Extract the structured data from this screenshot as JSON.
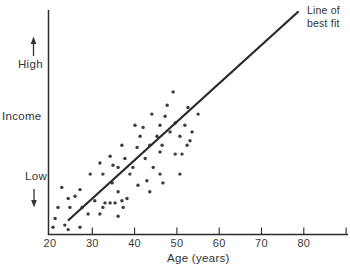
{
  "figure": {
    "background_color": "#ffffff",
    "ink_color": "#2b2b2b",
    "dot_color": "#3c3c3c"
  },
  "chart_data": {
    "type": "scatter",
    "xlabel": "Age (years)",
    "ylabel": "Income",
    "y_axis": {
      "high_label": "High",
      "low_label": "Low",
      "scale_note": "qualitative axis, arrows from Low to High, no numeric ticks"
    },
    "x_ticks_labeled": [
      20,
      30,
      40,
      50,
      60,
      70,
      80
    ],
    "x_ticks_marks": [
      30,
      40,
      50,
      60,
      70,
      80,
      90
    ],
    "xlim": [
      20,
      91
    ],
    "y_units": "relative income, 0 = baseline (Low end), 100 = top of axis",
    "ylim": [
      0,
      100
    ],
    "grid": false,
    "legend": null,
    "annotation": {
      "label_line1": "Line of",
      "label_line2": "best fit"
    },
    "best_fit_line": {
      "start": [
        24.4,
        6.3
      ],
      "end": [
        78.6,
        100
      ]
    },
    "points": [
      [
        20.7,
        3
      ],
      [
        21.2,
        7
      ],
      [
        21.9,
        12
      ],
      [
        22.8,
        21
      ],
      [
        23.5,
        4
      ],
      [
        24.3,
        2
      ],
      [
        24.3,
        16
      ],
      [
        24.7,
        12
      ],
      [
        25.9,
        17
      ],
      [
        27.1,
        20
      ],
      [
        27.1,
        3
      ],
      [
        27.6,
        12
      ],
      [
        29.0,
        9
      ],
      [
        29.5,
        27
      ],
      [
        30.6,
        15
      ],
      [
        31.8,
        9
      ],
      [
        31.8,
        32
      ],
      [
        32.5,
        27
      ],
      [
        32.5,
        12
      ],
      [
        33.0,
        14
      ],
      [
        34.2,
        35
      ],
      [
        34.2,
        14
      ],
      [
        34.7,
        23
      ],
      [
        34.9,
        31
      ],
      [
        35.4,
        14
      ],
      [
        36.1,
        8
      ],
      [
        36.1,
        19
      ],
      [
        36.1,
        30
      ],
      [
        37.0,
        15
      ],
      [
        37.0,
        40
      ],
      [
        37.3,
        12
      ],
      [
        37.7,
        34
      ],
      [
        38.2,
        16
      ],
      [
        38.9,
        27
      ],
      [
        39.6,
        30
      ],
      [
        40.1,
        49
      ],
      [
        40.6,
        39
      ],
      [
        40.8,
        22
      ],
      [
        41.3,
        44
      ],
      [
        42.0,
        48
      ],
      [
        42.5,
        34
      ],
      [
        42.9,
        24
      ],
      [
        43.6,
        19
      ],
      [
        43.6,
        40
      ],
      [
        44.1,
        54
      ],
      [
        44.4,
        30
      ],
      [
        45.3,
        44
      ],
      [
        46.0,
        49
      ],
      [
        46.0,
        37
      ],
      [
        46.0,
        27
      ],
      [
        46.5,
        40
      ],
      [
        46.7,
        23
      ],
      [
        47.2,
        53
      ],
      [
        47.7,
        58
      ],
      [
        48.4,
        46
      ],
      [
        49.1,
        64
      ],
      [
        49.6,
        50
      ],
      [
        49.6,
        36
      ],
      [
        50.7,
        44
      ],
      [
        50.7,
        27
      ],
      [
        51.2,
        36
      ],
      [
        51.9,
        49
      ],
      [
        52.4,
        40
      ],
      [
        52.6,
        57
      ],
      [
        53.1,
        42
      ],
      [
        53.6,
        46
      ],
      [
        55.0,
        54
      ]
    ]
  }
}
